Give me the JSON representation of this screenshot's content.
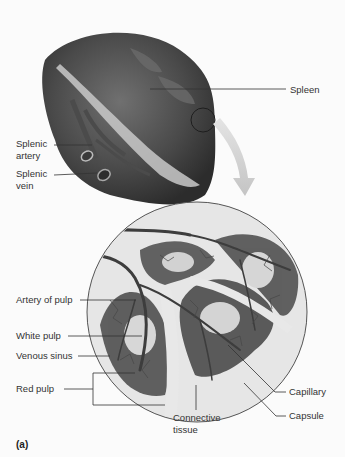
{
  "figure": {
    "panel_label": "(a)",
    "colors": {
      "background": "#fbfbfb",
      "organ_dark": "#3e3e3e",
      "organ_mid": "#5a5a5a",
      "hilum_edge": "#bdbdbd",
      "pulp_red": "#5b5b5b",
      "white_pulp": "#d9d9d9",
      "connective_tissue": "#e3e3e3",
      "arrow": "#c8c8c8",
      "leader_line": "#333333",
      "label_text": "#333333"
    }
  },
  "labels": {
    "spleen": "Spleen",
    "splenic_artery": [
      "Splenic",
      "artery"
    ],
    "splenic_vein": [
      "Splenic",
      "vein"
    ],
    "artery_of_pulp": "Artery of pulp",
    "white_pulp": "White pulp",
    "venous_sinus": "Venous sinus",
    "red_pulp": "Red pulp",
    "capillary": "Capillary",
    "capsule": "Capsule",
    "connective_tissue": [
      "Connective",
      "tissue"
    ]
  }
}
